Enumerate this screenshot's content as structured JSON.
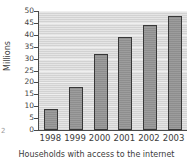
{
  "chart_data": {
    "type": "bar",
    "title": "",
    "xlabel": "Households with access to the internet",
    "ylabel": "Millions",
    "categories": [
      "1998",
      "1999",
      "2000",
      "2001",
      "2002",
      "2003"
    ],
    "values": [
      9,
      18,
      32,
      39,
      44,
      48
    ],
    "ylim": [
      0,
      50
    ],
    "yticks": [
      50,
      45,
      40,
      35,
      30,
      25,
      20,
      15,
      10,
      5,
      0
    ],
    "grid": true,
    "legend": "none",
    "series": [
      {
        "name": "Households with access to the internet",
        "values": [
          9,
          18,
          32,
          39,
          44,
          48
        ]
      }
    ],
    "colors": {
      "bar_fill": "#8e8e8e",
      "bar_outline": "#383838",
      "plot_background": "#d2d2d2",
      "gridline": "#efefef",
      "axis": "#4a4a4a",
      "text": "#3b3b3b"
    }
  },
  "artifact": {
    "edge_mark": "2"
  }
}
